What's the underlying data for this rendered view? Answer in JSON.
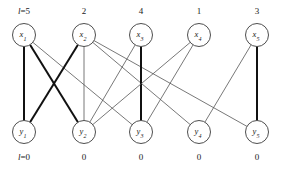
{
  "figure": {
    "type": "bipartite-graph",
    "width": 282,
    "height": 170,
    "background": "#ffffff"
  },
  "top_row": {
    "node_y": 35,
    "labels": [
      {
        "name": "x",
        "sub": "1",
        "x": 24
      },
      {
        "name": "x",
        "sub": "2",
        "x": 84
      },
      {
        "name": "x",
        "sub": "3",
        "x": 141
      },
      {
        "name": "x",
        "sub": "4",
        "x": 199
      },
      {
        "name": "x",
        "sub": "5",
        "x": 257
      }
    ],
    "annotations": [
      {
        "text": "l=5",
        "x": 24,
        "y": 6,
        "has_italic_l": true
      },
      {
        "text": "2",
        "x": 84,
        "y": 6,
        "has_italic_l": false
      },
      {
        "text": "4",
        "x": 141,
        "y": 6,
        "has_italic_l": false
      },
      {
        "text": "1",
        "x": 199,
        "y": 6,
        "has_italic_l": false
      },
      {
        "text": "3",
        "x": 257,
        "y": 6,
        "has_italic_l": false
      }
    ]
  },
  "bottom_row": {
    "node_y": 132,
    "labels": [
      {
        "name": "y",
        "sub": "1",
        "x": 24
      },
      {
        "name": "y",
        "sub": "2",
        "x": 84
      },
      {
        "name": "y",
        "sub": "3",
        "x": 141
      },
      {
        "name": "y",
        "sub": "4",
        "x": 199
      },
      {
        "name": "y",
        "sub": "5",
        "x": 257
      }
    ],
    "annotations": [
      {
        "text": "l=0",
        "x": 24,
        "y": 152,
        "has_italic_l": true
      },
      {
        "text": "0",
        "x": 84,
        "y": 152,
        "has_italic_l": false
      },
      {
        "text": "0",
        "x": 141,
        "y": 152,
        "has_italic_l": false
      },
      {
        "text": "0",
        "x": 199,
        "y": 152,
        "has_italic_l": false
      },
      {
        "text": "0",
        "x": 257,
        "y": 152,
        "has_italic_l": false
      }
    ]
  },
  "node_radius": 11.5,
  "edges": [
    {
      "from": "x1",
      "to": "y1",
      "weight": "thick"
    },
    {
      "from": "x1",
      "to": "y2",
      "weight": "thick"
    },
    {
      "from": "x1",
      "to": "y3",
      "weight": "thin"
    },
    {
      "from": "x2",
      "to": "y1",
      "weight": "thick"
    },
    {
      "from": "x2",
      "to": "y2",
      "weight": "thin"
    },
    {
      "from": "x2",
      "to": "y4",
      "weight": "thin"
    },
    {
      "from": "x2",
      "to": "y5",
      "weight": "thin"
    },
    {
      "from": "x3",
      "to": "y2",
      "weight": "thin"
    },
    {
      "from": "x3",
      "to": "y3",
      "weight": "thick"
    },
    {
      "from": "x4",
      "to": "y2",
      "weight": "thin"
    },
    {
      "from": "x4",
      "to": "y3",
      "weight": "thin"
    },
    {
      "from": "x5",
      "to": "y4",
      "weight": "thin"
    },
    {
      "from": "x5",
      "to": "y5",
      "weight": "thick"
    }
  ],
  "colors": {
    "thin_edge": "#555555",
    "thick_edge": "#111111",
    "node_stroke": "#3a3a3a",
    "node_fill": "#ffffff",
    "text": "#1a1a1a"
  }
}
